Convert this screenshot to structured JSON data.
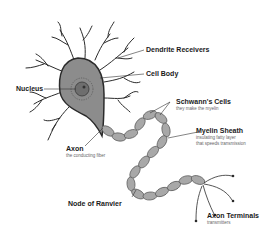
{
  "diagram": {
    "colors": {
      "cell_body": "#8c8c8c",
      "nucleus": "#6e6e6e",
      "outline": "#2b2b2b",
      "myelin": "#a8a8a8",
      "background": "#ffffff"
    },
    "labels": {
      "dendrite": {
        "title": "Dendrite Receivers"
      },
      "cell_body": {
        "title": "Cell Body"
      },
      "nucleus": {
        "title": "Nucleus"
      },
      "schwann": {
        "title": "Schwann's Cells",
        "subtitle": "they make the myelin"
      },
      "myelin": {
        "title": "Myelin Sheath",
        "subtitle_1": "insulating fatty layer",
        "subtitle_2": "that speeds transmission"
      },
      "axon": {
        "title": "Axon",
        "subtitle": "the conducting fiber"
      },
      "node": {
        "title": "Node of Ranvier"
      },
      "terminals": {
        "title": "Axon Terminals",
        "subtitle": "transmitters"
      }
    }
  }
}
